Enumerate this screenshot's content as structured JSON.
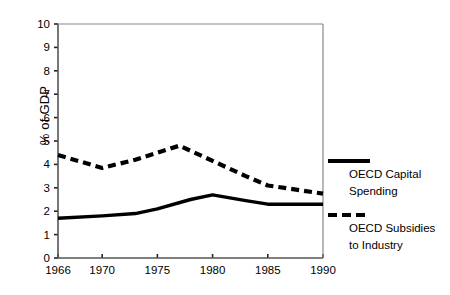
{
  "chart_data": {
    "type": "line",
    "title": "",
    "xlabel": "",
    "ylabel": "% of GDP",
    "xlim": [
      1966,
      1990
    ],
    "ylim": [
      0,
      10
    ],
    "yticks": [
      "0",
      "1",
      "2",
      "3",
      "4",
      "5",
      "6",
      "7",
      "8",
      "9",
      "10"
    ],
    "xticks": [
      "1966",
      "1970",
      "1975",
      "1980",
      "1985",
      "1990"
    ],
    "grid": false,
    "legend_position": "right",
    "series": [
      {
        "name": "OECD Capital Spending",
        "style": "solid",
        "color": "#000000",
        "x": [
          1966,
          1970,
          1973,
          1975,
          1978,
          1980,
          1983,
          1985,
          1990
        ],
        "values": [
          1.7,
          1.8,
          1.9,
          2.1,
          2.5,
          2.7,
          2.45,
          2.3,
          2.3
        ]
      },
      {
        "name": "OECD Subsidies to Industry",
        "style": "dashed",
        "color": "#000000",
        "x": [
          1966,
          1970,
          1973,
          1975,
          1977,
          1980,
          1983,
          1985,
          1990
        ],
        "values": [
          4.4,
          3.85,
          4.2,
          4.5,
          4.8,
          4.15,
          3.5,
          3.1,
          2.75
        ]
      }
    ]
  },
  "axis": {
    "ylabel": "% of GDP"
  },
  "legend": {
    "entries": [
      {
        "label_line1": "OECD Capital",
        "label_line2": "Spending",
        "style": "solid"
      },
      {
        "label_line1": "OECD Subsidies",
        "label_line2": "to Industry",
        "style": "dashed"
      }
    ]
  }
}
